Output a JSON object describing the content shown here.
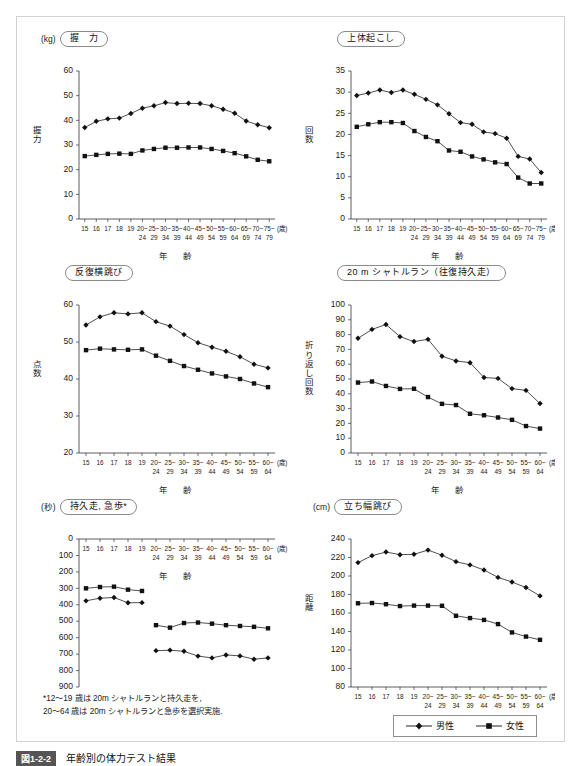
{
  "figure": {
    "caption_number": "図1-2-2",
    "caption_text": "年齢別の体力テスト結果",
    "footnote": "*12～19 歳は 20m シャトルランと持久走を,\n 20～64 歳は 20m シャトルランと急歩を選択実施."
  },
  "legend": {
    "position": "bottom-right",
    "items": [
      {
        "label": "男性",
        "marker": "diamond"
      },
      {
        "label": "女性",
        "marker": "square"
      }
    ]
  },
  "axis_labels": {
    "x_title": "年　齢",
    "x_unit": "(歳)",
    "ages_full": [
      "15",
      "16",
      "17",
      "18",
      "19",
      "20~",
      "25~",
      "30~",
      "35~",
      "40~",
      "45~",
      "50~",
      "55~",
      "60~",
      "65~",
      "70~",
      "75~"
    ],
    "ages_full_second": [
      "",
      "",
      "",
      "",
      "",
      "24",
      "29",
      "34",
      "39",
      "44",
      "49",
      "54",
      "59",
      "64",
      "69",
      "74",
      "79"
    ],
    "ages_short": [
      "15",
      "16",
      "17",
      "18",
      "19",
      "20~",
      "25~",
      "30~",
      "35~",
      "40~",
      "45~",
      "50~",
      "55~",
      "60~"
    ],
    "ages_short_second": [
      "",
      "",
      "",
      "",
      "",
      "24",
      "29",
      "34",
      "39",
      "44",
      "49",
      "54",
      "59",
      "64"
    ]
  },
  "chart_data": [
    {
      "id": "grip-strength",
      "type": "line",
      "title": "握　力",
      "unit": "(kg)",
      "ylabel": "握力",
      "xlabel": "年　齢",
      "ylim": [
        0,
        60
      ],
      "yticks": [
        0,
        10,
        20,
        30,
        40,
        50,
        60
      ],
      "inverted": false,
      "grid": false,
      "categories": [
        "15",
        "16",
        "17",
        "18",
        "19",
        "20~24",
        "25~29",
        "30~34",
        "35~39",
        "40~44",
        "45~49",
        "50~54",
        "55~59",
        "60~64",
        "65~69",
        "70~74",
        "75~79"
      ],
      "series": [
        {
          "name": "男性",
          "marker": "diamond",
          "values": [
            37.1,
            39.6,
            40.6,
            40.9,
            42.8,
            44.9,
            45.9,
            47.2,
            46.8,
            46.9,
            46.8,
            45.9,
            44.5,
            42.9,
            39.7,
            38.2,
            37.0
          ]
        },
        {
          "name": "女性",
          "marker": "square",
          "values": [
            25.5,
            26.0,
            26.4,
            26.5,
            26.4,
            27.8,
            28.4,
            28.9,
            28.9,
            29.0,
            29.0,
            28.4,
            27.6,
            26.7,
            25.4,
            24.0,
            23.4
          ]
        }
      ]
    },
    {
      "id": "sit-ups",
      "type": "line",
      "title": "上体起こし",
      "unit": "",
      "ylabel": "回数",
      "xlabel": "年　齢",
      "ylim": [
        0,
        35
      ],
      "yticks": [
        0,
        5,
        10,
        15,
        20,
        25,
        30,
        35
      ],
      "inverted": false,
      "grid": false,
      "categories": [
        "15",
        "16",
        "17",
        "18",
        "19",
        "20~24",
        "25~29",
        "30~34",
        "35~39",
        "40~44",
        "45~49",
        "50~54",
        "55~59",
        "60~64",
        "65~69",
        "70~74",
        "75~79"
      ],
      "series": [
        {
          "name": "男性",
          "marker": "diamond",
          "values": [
            29.2,
            29.8,
            30.5,
            29.9,
            30.5,
            29.5,
            28.3,
            27.0,
            24.9,
            22.8,
            22.4,
            20.6,
            20.2,
            19.1,
            14.8,
            14.2,
            11.0
          ]
        },
        {
          "name": "女性",
          "marker": "square",
          "values": [
            21.8,
            22.4,
            22.9,
            22.9,
            22.7,
            20.8,
            19.4,
            18.4,
            16.2,
            15.9,
            14.8,
            14.1,
            13.4,
            13.0,
            9.8,
            8.4,
            8.4
          ]
        }
      ]
    },
    {
      "id": "side-steps",
      "type": "line",
      "title": "反復横跳び",
      "unit": "",
      "ylabel": "点数",
      "xlabel": "年　齢",
      "ylim": [
        20,
        60
      ],
      "yticks": [
        20,
        30,
        40,
        50,
        60
      ],
      "inverted": false,
      "grid": false,
      "categories": [
        "15",
        "16",
        "17",
        "18",
        "19",
        "20~24",
        "25~29",
        "30~34",
        "35~39",
        "40~44",
        "45~49",
        "50~54",
        "55~59",
        "60~64"
      ],
      "series": [
        {
          "name": "男性",
          "marker": "diamond",
          "values": [
            54.6,
            56.8,
            57.9,
            57.6,
            57.9,
            55.5,
            54.3,
            52.0,
            49.8,
            48.6,
            47.5,
            46.0,
            44.0,
            43.0
          ]
        },
        {
          "name": "女性",
          "marker": "square",
          "values": [
            47.8,
            48.2,
            48.0,
            47.9,
            48.0,
            46.3,
            44.9,
            43.5,
            42.5,
            41.5,
            40.7,
            40.0,
            38.8,
            37.8
          ]
        }
      ]
    },
    {
      "id": "shuttle-run",
      "type": "line",
      "title": "20 m シャトルラン（往復持久走）",
      "unit": "",
      "ylabel": "折り返し回数",
      "xlabel": "年　齢",
      "ylim": [
        0,
        100
      ],
      "yticks": [
        0,
        10,
        20,
        30,
        40,
        50,
        60,
        70,
        80,
        90,
        100
      ],
      "inverted": false,
      "grid": false,
      "categories": [
        "15",
        "16",
        "17",
        "18",
        "19",
        "20~24",
        "25~29",
        "30~34",
        "35~39",
        "40~44",
        "45~49",
        "50~54",
        "55~59",
        "60~64"
      ],
      "series": [
        {
          "name": "男性",
          "marker": "diamond",
          "values": [
            77.5,
            83.5,
            86.8,
            78.6,
            75.3,
            76.8,
            65.4,
            62.2,
            61.0,
            51.0,
            50.4,
            43.5,
            42.3,
            33.4
          ]
        },
        {
          "name": "女性",
          "marker": "square",
          "values": [
            47.6,
            48.3,
            45.3,
            43.3,
            43.4,
            37.8,
            33.2,
            32.4,
            26.5,
            25.5,
            24.0,
            22.4,
            18.2,
            16.5
          ]
        }
      ]
    },
    {
      "id": "endurance-run-walk",
      "type": "line",
      "title": "持久走, 急歩*",
      "unit": "(秒)",
      "ylabel": "",
      "xlabel": "年　齢",
      "ylim": [
        0,
        900
      ],
      "yticks": [
        0,
        100,
        200,
        300,
        400,
        500,
        600,
        700,
        800,
        900
      ],
      "inverted": true,
      "grid": false,
      "categories": [
        "15",
        "16",
        "17",
        "18",
        "19",
        "20~24",
        "25~29",
        "30~34",
        "35~39",
        "40~44",
        "45~49",
        "50~54",
        "55~59",
        "60~64"
      ],
      "series": [
        {
          "name": "男性",
          "marker": "diamond",
          "values": [
            376,
            360,
            356,
            388,
            387,
            679,
            676,
            683,
            712,
            723,
            705,
            711,
            731,
            723
          ]
        },
        {
          "name": "女性",
          "marker": "square",
          "values": [
            300,
            292,
            290,
            308,
            316,
            524,
            539,
            511,
            508,
            515,
            524,
            529,
            534,
            543
          ]
        }
      ]
    },
    {
      "id": "standing-long-jump",
      "type": "line",
      "title": "立ち幅跳び",
      "unit": "(cm)",
      "ylabel": "距離",
      "xlabel": "年　齢",
      "ylim": [
        80,
        240
      ],
      "yticks": [
        80,
        100,
        120,
        140,
        160,
        180,
        200,
        220,
        240
      ],
      "inverted": false,
      "grid": false,
      "categories": [
        "15",
        "16",
        "17",
        "18",
        "19",
        "20~24",
        "25~29",
        "30~34",
        "35~39",
        "40~44",
        "45~49",
        "50~54",
        "55~59",
        "60~64"
      ],
      "series": [
        {
          "name": "男性",
          "marker": "diamond",
          "values": [
            214.5,
            222.0,
            226.0,
            223.0,
            223.5,
            228.0,
            222.5,
            215.5,
            212.0,
            206.5,
            198.5,
            193.5,
            187.5,
            178.5
          ]
        },
        {
          "name": "女性",
          "marker": "square",
          "values": [
            170.5,
            170.8,
            169.5,
            167.5,
            168.0,
            168.0,
            167.8,
            157.0,
            154.5,
            152.5,
            148.0,
            139.0,
            134.5,
            131.0
          ]
        }
      ]
    }
  ]
}
